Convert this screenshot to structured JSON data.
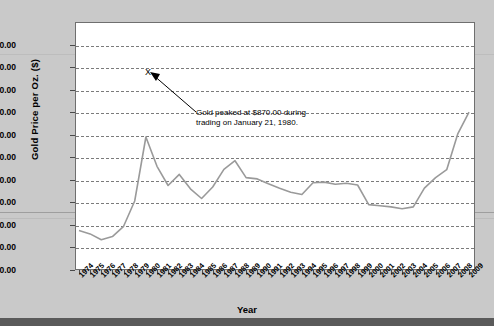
{
  "chart_data": {
    "type": "line",
    "title": "",
    "xlabel": "Year",
    "ylabel": "Gold Price per Oz. ($)",
    "ylim": [
      0,
      1100
    ],
    "ytick_labels": [
      "1,000.00",
      "900.00",
      "800.00",
      "700.00",
      "600.00",
      "500.00",
      "400.00",
      "300.00",
      "200.00",
      "100.00",
      "0.00"
    ],
    "ytick_values": [
      1000,
      900,
      800,
      700,
      600,
      500,
      400,
      300,
      200,
      100,
      0
    ],
    "grid": true,
    "legend": "none",
    "line_color": "#9a9a9a",
    "categories": [
      "1974",
      "1975",
      "1976",
      "1977",
      "1978",
      "1979",
      "1980",
      "1981",
      "1982",
      "1983",
      "1984",
      "1985",
      "1986",
      "1987",
      "1988",
      "1989",
      "1990",
      "1991",
      "1992",
      "1993",
      "1994",
      "1995",
      "1996",
      "1997",
      "1998",
      "1999",
      "2000",
      "2001",
      "2002",
      "2003",
      "2004",
      "2005",
      "2006",
      "2007",
      "2008",
      "2009"
    ],
    "x": [
      1974,
      1975,
      1976,
      1977,
      1978,
      1979,
      1980,
      1981,
      1982,
      1983,
      1984,
      1985,
      1986,
      1987,
      1988,
      1989,
      1990,
      1991,
      1992,
      1993,
      1994,
      1995,
      1996,
      1997,
      1998,
      1999,
      2000,
      2001,
      2002,
      2003,
      2004,
      2005,
      2006,
      2007,
      2008,
      2009
    ],
    "values": [
      175.0,
      160.0,
      134.0,
      148.0,
      194.0,
      306.0,
      590.0,
      460.0,
      375.0,
      424.0,
      360.0,
      317.0,
      368.0,
      446.0,
      485.0,
      410.0,
      404.0,
      383.0,
      363.0,
      345.0,
      335.0,
      387.0,
      390.0,
      380.0,
      385.0,
      377.0,
      290.0,
      285.0,
      280.0,
      272.0,
      280.0,
      363.0,
      410.0,
      445.0,
      605.0,
      700.0
    ],
    "annotations": [
      {
        "name": "peak-callout",
        "text_line1": "Gold peaked at $870.00 during",
        "text_line2": "trading on January 21, 1980.",
        "marker": "X",
        "marker_value": 870
      }
    ]
  },
  "axes": {
    "y_title": "Gold Price per Oz. ($)",
    "x_title": "Year"
  }
}
